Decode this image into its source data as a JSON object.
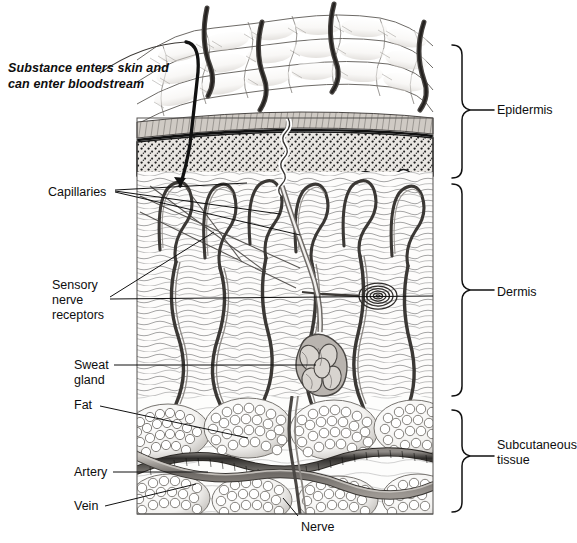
{
  "figure": {
    "type": "anatomical-cross-section",
    "background_color": "#ffffff",
    "ink_color": "#111111"
  },
  "annotation": {
    "callout_text": "Substance enters skin and can enter bloodstream"
  },
  "left_labels": [
    {
      "id": "capillaries",
      "text": "Capillaries",
      "x": 48,
      "y": 185
    },
    {
      "id": "sensory-nerve",
      "text": "Sensory\nnerve\nreceptors",
      "x": 52,
      "y": 278
    },
    {
      "id": "sweat-gland",
      "text": "Sweat\ngland",
      "x": 74,
      "y": 358
    },
    {
      "id": "fat",
      "text": "Fat",
      "x": 74,
      "y": 398
    },
    {
      "id": "artery",
      "text": "Artery",
      "x": 74,
      "y": 465
    },
    {
      "id": "vein",
      "text": "Vein",
      "x": 74,
      "y": 499
    }
  ],
  "bottom_labels": [
    {
      "id": "nerve",
      "text": "Nerve",
      "x": 301,
      "y": 520
    }
  ],
  "layer_braces": [
    {
      "id": "epidermis",
      "text": "Epidermis",
      "top": 45,
      "bottom": 178,
      "label_x": 497,
      "label_y": 103
    },
    {
      "id": "dermis",
      "text": "Dermis",
      "top": 184,
      "bottom": 396,
      "label_x": 497,
      "label_y": 285
    },
    {
      "id": "subcutaneous",
      "text": "Subcutaneous\ntissue",
      "top": 410,
      "bottom": 512,
      "label_x": 497,
      "label_y": 446
    }
  ],
  "structures": [
    {
      "id": "hair-shaft",
      "label": "hair shaft",
      "count": 4
    },
    {
      "id": "stratum-corneum",
      "label": "stratum corneum band",
      "count": 1
    },
    {
      "id": "epidermis-stipple",
      "label": "stippled epidermis",
      "count": 1
    },
    {
      "id": "rete-ridge",
      "label": "rete ridge",
      "count": 9
    },
    {
      "id": "capillary-loop",
      "label": "capillary loop",
      "count": 8
    },
    {
      "id": "pacinian-corpuscle",
      "label": "pacinian corpuscle",
      "count": 1
    },
    {
      "id": "sweat-gland-coil",
      "label": "sweat gland coil",
      "count": 1
    },
    {
      "id": "sweat-duct",
      "label": "sweat duct",
      "count": 1
    },
    {
      "id": "fat-lobule",
      "label": "fat lobule",
      "count": 8
    },
    {
      "id": "artery-vessel",
      "label": "artery",
      "count": 1
    },
    {
      "id": "vein-vessel",
      "label": "vein",
      "count": 1
    },
    {
      "id": "nerve-bundle",
      "label": "nerve",
      "count": 1
    },
    {
      "id": "substance-arrow",
      "label": "substance penetration path",
      "count": 1
    }
  ]
}
